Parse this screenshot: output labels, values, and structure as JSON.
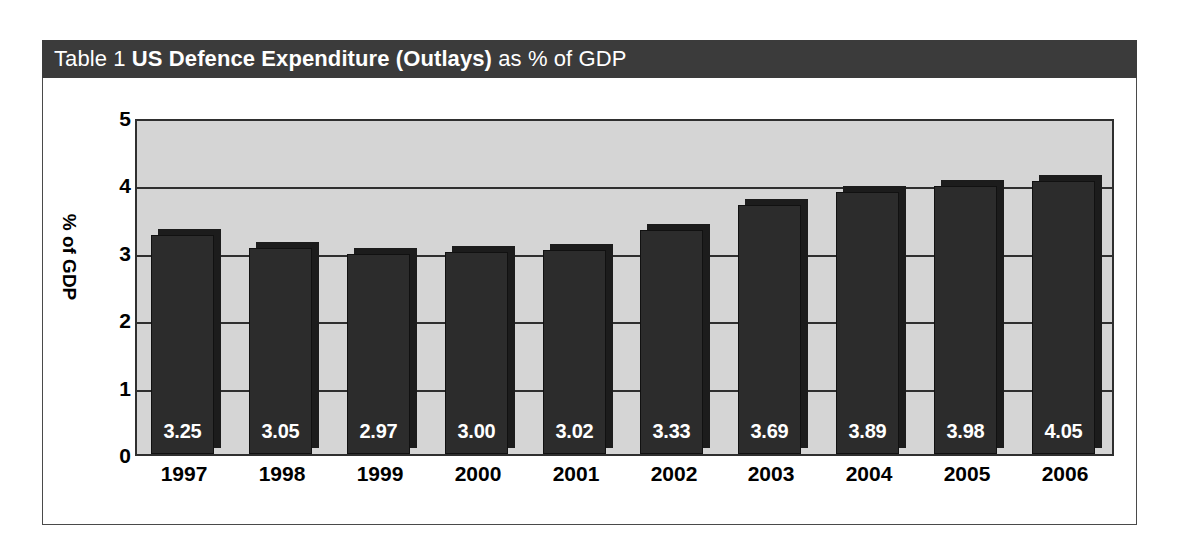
{
  "title": {
    "prefix": "Table 1",
    "main": " US Defence Expenditure (Outlays)",
    "suffix": " as % of GDP",
    "full": "Table 1 US Defence Expenditure (Outlays) as % of GDP"
  },
  "colors": {
    "title_bar": "#3b3b3b",
    "title_text": "#ffffff",
    "plot_background": "#d5d5d5",
    "bar_face": "#2c2c2c",
    "bar_shadow": "#1c1c1c",
    "gridline": "#2f2f2f",
    "frame_border": "#4a4a4a",
    "page_background": "#ffffff",
    "axis_text": "#000000",
    "bar_label_text": "#ffffff"
  },
  "chart_data": {
    "type": "bar",
    "title": "Table 1 US Defence Expenditure (Outlays) as % of GDP",
    "categories": [
      "1997",
      "1998",
      "1999",
      "2000",
      "2001",
      "2002",
      "2003",
      "2004",
      "2005",
      "2006"
    ],
    "values": [
      3.25,
      3.05,
      2.97,
      3.0,
      3.02,
      3.33,
      3.69,
      3.89,
      3.98,
      4.05
    ],
    "value_labels": [
      "3.25",
      "3.05",
      "2.97",
      "3.00",
      "3.02",
      "3.33",
      "3.69",
      "3.89",
      "3.98",
      "4.05"
    ],
    "xlabel": "",
    "ylabel": "% of GDP",
    "ylim": [
      0,
      5
    ],
    "yticks": [
      0,
      1,
      2,
      3,
      4,
      5
    ],
    "ytick_labels": [
      "0",
      "1",
      "2",
      "3",
      "4",
      "5"
    ],
    "grid": true,
    "legend": false,
    "legend_position": "none"
  }
}
